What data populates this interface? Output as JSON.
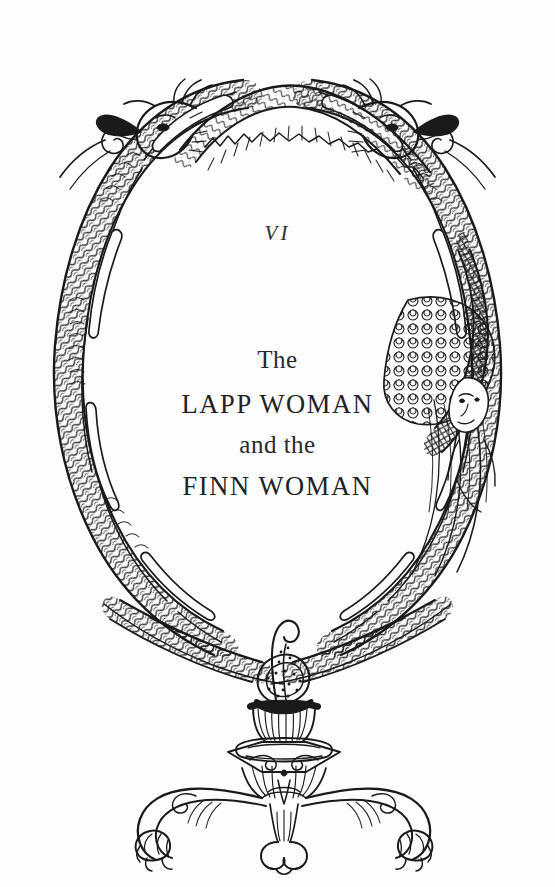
{
  "page": {
    "kind": "book-chapter-title-page",
    "background_color": "#fdfdfd",
    "ink_color": "#1a1a1c",
    "text_color": "#2a2a2e",
    "width": 555,
    "height": 887
  },
  "chapter": {
    "number_roman": "VI",
    "title_line_1": "The",
    "title_line_2": "LAPP WOMAN",
    "title_line_3": "and the",
    "title_line_4": "FINN WOMAN"
  },
  "illustration": {
    "description": "Pen-and-ink oval wreath of two intertwined serpent-dragons resting on a rococo tripod pedestal",
    "style": "pen-and-ink line engraving",
    "elements": [
      "dragon-head-left",
      "dragon-head-right",
      "twisted-serpent-body-left",
      "twisted-serpent-body-right",
      "scaled-serpent-tail-right",
      "siren-figure-right",
      "serpent-knot-bottom",
      "pedestal-urn",
      "tripod-base",
      "claw-foot-left",
      "claw-foot-center",
      "claw-foot-right"
    ]
  }
}
